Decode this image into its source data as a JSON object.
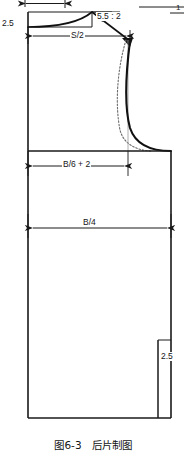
{
  "figure": {
    "caption": "图6-3　后片制图",
    "caption_id": "图6-3",
    "caption_title": "后片制图",
    "type": "garment-pattern-technical-drawing",
    "piece": "back-bodice"
  },
  "labels": {
    "neck_drop": "2.5",
    "shoulder_slope": "5.5 : 2",
    "reference_one": "1",
    "shoulder_width": "S/2",
    "chest_width": "B/6 + 2",
    "half_bust": "B/4",
    "side_slit": "2.5"
  },
  "colors": {
    "line": "#1a1a1a",
    "bold_line": "#111111",
    "dotted_line": "#6b6b6b",
    "thin_line": "#444444",
    "background": "#ffffff",
    "text": "#161616"
  },
  "geometry": {
    "outline_left_x": 28,
    "outline_right_x": 171,
    "outline_top_y": 12,
    "outline_bottom_y": 418,
    "chest_line_y": 151,
    "bust_dim_y": 228,
    "shoulder_dim_y": 36,
    "chest_dim_y": 166,
    "shoulder_point": [
      120,
      26
    ],
    "neck_point": [
      92,
      14
    ],
    "armhole_bottom": [
      152,
      151
    ],
    "slit_x": 158,
    "slit_top_y": 340
  },
  "elements": {
    "top_dimension_arrow": "neck-width-double-arrow",
    "neckline": "back-neckline-curve",
    "shoulder_line": "shoulder-seam-line",
    "armhole": "armhole-curve-bold",
    "armhole_guide": "armhole-guide-dotted",
    "side_seam": "side-seam-line",
    "hem": "hem-line",
    "center_back": "center-back-fold-line"
  }
}
